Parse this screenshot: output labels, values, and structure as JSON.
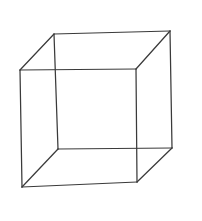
{
  "figure": {
    "canvas": {
      "width": 202,
      "height": 221
    },
    "background_color": "#ffffff",
    "line_color": "#3a3a3a",
    "line_width": 1.25,
    "style": "hand-drawn wireframe, all twelve edges visible"
  },
  "geometry": {
    "vertices": {
      "front_top_left": {
        "name": "front-top-left",
        "x": 20,
        "y": 70
      },
      "front_top_right": {
        "name": "front-top-right",
        "x": 136,
        "y": 69
      },
      "front_bottom_right": {
        "name": "front-bottom-right",
        "x": 137,
        "y": 182
      },
      "front_bottom_left": {
        "name": "front-bottom-left",
        "x": 22,
        "y": 187
      },
      "back_top_left": {
        "name": "back-top-left",
        "x": 54,
        "y": 34
      },
      "back_top_right": {
        "name": "back-top-right",
        "x": 170,
        "y": 31
      },
      "back_bottom_right": {
        "name": "back-bottom-right",
        "x": 172,
        "y": 148
      },
      "back_bottom_left": {
        "name": "back-bottom-left",
        "x": 58,
        "y": 149
      }
    },
    "edges": {
      "front_top": {
        "label": "front-top-edge",
        "path": "M 20 70 L 136 69"
      },
      "front_right": {
        "label": "front-right-edge",
        "path": "M 136 69 L 137 182"
      },
      "front_bottom": {
        "label": "front-bottom-edge",
        "path": "M 137 182 L 22 187"
      },
      "front_left": {
        "label": "front-left-edge",
        "path": "M 22 187 L 20 70"
      },
      "back_top": {
        "label": "back-top-edge",
        "path": "M 54 34 L 170 31"
      },
      "back_right": {
        "label": "back-right-edge",
        "path": "M 170 31 L 172 148"
      },
      "back_bottom": {
        "label": "back-bottom-edge",
        "path": "M 172 148 L 58 149"
      },
      "back_left": {
        "label": "back-left-edge",
        "path": "M 58 149 L 54 34"
      },
      "connect_top_left": {
        "label": "connecting-edge-top-left",
        "path": "M 20 70 L 54 34"
      },
      "connect_top_right": {
        "label": "connecting-edge-top-right",
        "path": "M 136 69 L 170 31"
      },
      "connect_bottom_right": {
        "label": "connecting-edge-bottom-right",
        "path": "M 137 182 L 172 148"
      },
      "connect_bottom_left": {
        "label": "connecting-edge-bottom-left",
        "path": "M 22 187 L 58 149"
      }
    },
    "faces": [
      "front-square-face",
      "back-square-face",
      "top-face",
      "bottom-face",
      "left-face",
      "right-face"
    ]
  }
}
